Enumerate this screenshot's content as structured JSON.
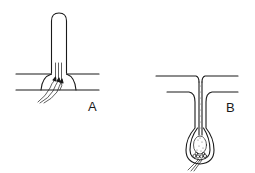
{
  "figure": {
    "panels": [
      {
        "id": "A",
        "label": "A",
        "description": "Tube-like projection rising from a layer bounded by two horizontal lines, with a dome-shaped base containing converging fibers (nerve endings) that pass up into the projection"
      },
      {
        "id": "B",
        "label": "B",
        "description": "Hair-follicle-like structure: a narrow stippled shaft descending from the surface through two layer lines into a bulb with a stippled core and cellular base, with fibers exiting below"
      }
    ],
    "colors": {
      "line": "#1a1a1a",
      "background": "#ffffff"
    }
  }
}
